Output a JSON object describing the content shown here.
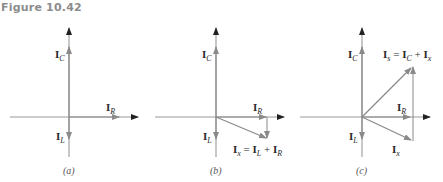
{
  "figure": {
    "title": "Figure 10.42",
    "colors": {
      "axis": "#9a9a9a",
      "axis_arrowhead": "#222222",
      "phasor": "#8a8a8a",
      "text": "#2a2a2a",
      "title": "#8c8c8c"
    }
  },
  "panels": [
    {
      "id": "a",
      "caption": "(a)",
      "labels": {
        "ic": "I",
        "ic_sub": "C",
        "ir": "I",
        "ir_sub": "R",
        "il": "I",
        "il_sub": "L"
      }
    },
    {
      "id": "b",
      "caption": "(b)",
      "labels": {
        "ic": "I",
        "ic_sub": "C",
        "ir": "I",
        "ir_sub": "R",
        "il": "I",
        "il_sub": "L",
        "sum_lhs": "I",
        "sum_lhs_sub": "x",
        "sum_eq": " = ",
        "sum_t1": "I",
        "sum_t1_sub": "L",
        "sum_plus": " + ",
        "sum_t2": "I",
        "sum_t2_sub": "R"
      }
    },
    {
      "id": "c",
      "caption": "(c)",
      "labels": {
        "ic": "I",
        "ic_sub": "C",
        "ir": "I",
        "ir_sub": "R",
        "il": "I",
        "il_sub": "L",
        "sum_lhs": "I",
        "sum_lhs_sub": "s",
        "sum_eq": " = ",
        "sum_t1": "I",
        "sum_t1_sub": "C",
        "sum_plus": " + ",
        "sum_t2": "I",
        "sum_t2_sub": "x",
        "ix": "I",
        "ix_sub": "x"
      }
    }
  ]
}
